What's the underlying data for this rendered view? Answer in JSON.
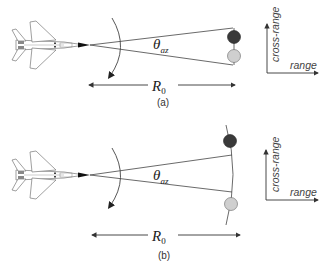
{
  "figure": {
    "panels": [
      {
        "id": "a",
        "caption": "(a)",
        "angle_label": "θ",
        "angle_subscript": "az",
        "range_label": "R",
        "range_subscript": "0",
        "axes": {
          "vertical_label": "cross-range",
          "horizontal_label": "range"
        },
        "targets": [
          {
            "shade": "dark",
            "color": "#3a3a3a"
          },
          {
            "shade": "light",
            "color": "#cfcfcf"
          }
        ],
        "target_connector": "straight"
      },
      {
        "id": "b",
        "caption": "(b)",
        "angle_label": "θ",
        "angle_subscript": "az",
        "range_label": "R",
        "range_subscript": "0",
        "axes": {
          "vertical_label": "cross-range",
          "horizontal_label": "range"
        },
        "targets": [
          {
            "shade": "dark",
            "color": "#3a3a3a"
          },
          {
            "shade": "light",
            "color": "#cfcfcf"
          }
        ],
        "target_connector": "arc"
      }
    ],
    "colors": {
      "line": "#444444",
      "aircraft_outline": "#666666",
      "background": "#ffffff"
    }
  }
}
